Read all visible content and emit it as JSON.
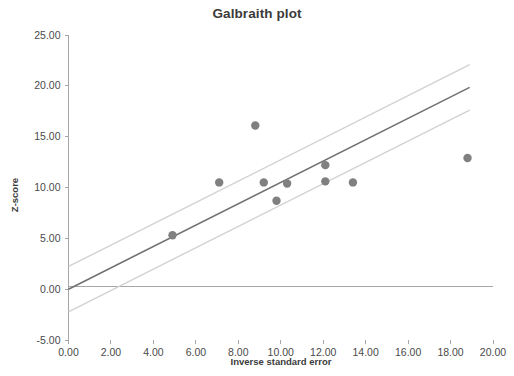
{
  "chart_data": {
    "type": "scatter",
    "title": "Galbraith plot",
    "xlabel": "Inverse standard error",
    "ylabel": "Z-score",
    "xlim": [
      0,
      20
    ],
    "ylim": [
      -5,
      25
    ],
    "grid": false,
    "legend": "none",
    "x_ticks": [
      "0.00",
      "2.00",
      "4.00",
      "6.00",
      "8.00",
      "10.00",
      "12.00",
      "14.00",
      "16.00",
      "18.00",
      "20.00"
    ],
    "x_tick_values": [
      0,
      2,
      4,
      6,
      8,
      10,
      12,
      14,
      16,
      18,
      20
    ],
    "y_ticks": [
      "25.00",
      "20.00",
      "15.00",
      "10.00",
      "5.00",
      "0.00",
      "-5.00"
    ],
    "y_tick_values": [
      25,
      20,
      15,
      10,
      5,
      0,
      -5
    ],
    "points": [
      {
        "x": 4.9,
        "y": 5.3
      },
      {
        "x": 7.1,
        "y": 10.5
      },
      {
        "x": 8.8,
        "y": 16.1
      },
      {
        "x": 9.2,
        "y": 10.5
      },
      {
        "x": 9.8,
        "y": 8.7
      },
      {
        "x": 10.3,
        "y": 10.4
      },
      {
        "x": 12.1,
        "y": 12.2
      },
      {
        "x": 12.1,
        "y": 10.6
      },
      {
        "x": 13.4,
        "y": 10.5
      },
      {
        "x": 18.8,
        "y": 12.9
      }
    ],
    "series": [
      {
        "name": "regression",
        "kind": "line",
        "slope": 1.05,
        "intercept": 0,
        "x": [
          0,
          18.9
        ],
        "values": [
          0,
          19.85
        ],
        "color": "#717171"
      },
      {
        "name": "upper-confidence-bound",
        "kind": "line",
        "slope": 1.05,
        "intercept": 2.23,
        "x": [
          0,
          18.9
        ],
        "values": [
          2.23,
          22.08
        ],
        "color": "#d2d2d2"
      },
      {
        "name": "lower-confidence-bound",
        "kind": "line",
        "slope": 1.05,
        "intercept": -2.23,
        "x": [
          0,
          18.9
        ],
        "values": [
          -2.23,
          17.62
        ],
        "color": "#d2d2d2"
      }
    ],
    "point_color": "#808080",
    "axis_color": "#a6a6a6"
  }
}
